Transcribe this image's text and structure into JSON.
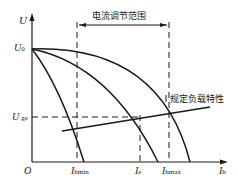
{
  "diagram": {
    "title_bracket": "电流调节范围",
    "load_label": "规定负载特性",
    "axes": {
      "y_label": "U",
      "x_label": "I",
      "x_label_sub": "h",
      "origin": "O"
    },
    "y_ticks": [
      {
        "main": "U",
        "sub": "0"
      },
      {
        "main": "U",
        "sub": "ge"
      }
    ],
    "x_ticks": [
      {
        "main": "I",
        "sub": "hmin"
      },
      {
        "main": "I",
        "sub": "e"
      },
      {
        "main": "I",
        "sub": "hmax"
      }
    ],
    "colors": {
      "line": "#1a1a1a",
      "background": "#ffffff"
    }
  }
}
